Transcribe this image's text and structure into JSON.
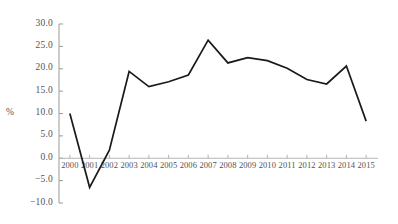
{
  "chart_data": {
    "type": "line",
    "title": "",
    "subtitle": "",
    "xlabel": "",
    "ylabel": "%",
    "categories": [
      "2000",
      "2001",
      "2002",
      "2003",
      "2004",
      "2005",
      "2006",
      "2007",
      "2008",
      "2009",
      "2010",
      "2011",
      "2012",
      "2013",
      "2014",
      "2015"
    ],
    "values": [
      10.0,
      -6.5,
      1.8,
      19.4,
      16.0,
      17.1,
      18.6,
      26.4,
      21.3,
      22.5,
      21.8,
      20.1,
      17.6,
      16.6,
      20.6,
      8.3
    ],
    "series": [
      {
        "name": "",
        "values": [
          10.0,
          -6.5,
          1.8,
          19.4,
          16.0,
          17.1,
          18.6,
          26.4,
          21.3,
          22.5,
          21.8,
          20.1,
          17.6,
          16.6,
          20.6,
          8.3
        ]
      }
    ],
    "ylim": [
      -10.0,
      30.0
    ],
    "yticks": [
      30.0,
      25.0,
      20.0,
      15.0,
      10.0,
      5.0,
      0.0,
      -5.0,
      -10.0
    ],
    "ytick_labels": [
      "30.0",
      "25.0",
      "20.0",
      "15.0",
      "10.0",
      "5.0",
      "0.0",
      "−5.0",
      "−10.0"
    ],
    "xtick_labels": [
      "2000",
      "2001",
      "2002",
      "2003",
      "2004",
      "2005",
      "2006",
      "2007",
      "2008",
      "2009",
      "2010",
      "2011",
      "2012",
      "2013",
      "2014",
      "2015"
    ],
    "grid": false,
    "legend": "none",
    "line_color": "#1a1a1a",
    "axis_color": "#9a9a9a",
    "zero_line_color": "#b5b5b5",
    "text_color": "#555253"
  }
}
